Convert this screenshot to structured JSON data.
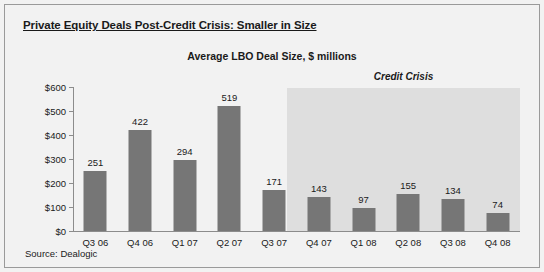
{
  "title": "Private Equity Deals Post-Credit Crisis: Smaller in Size",
  "source": "Source: Dealogic",
  "chart_data": {
    "type": "bar",
    "title": "Average LBO Deal Size, $ millions",
    "xlabel": "",
    "ylabel": "",
    "ylim": [
      0,
      600
    ],
    "ytick_labels": [
      "$0",
      "$100",
      "$200",
      "$300",
      "$400",
      "$500",
      "$600"
    ],
    "ytick_values": [
      0,
      100,
      200,
      300,
      400,
      500,
      600
    ],
    "grid": false,
    "legend": "none",
    "categories": [
      "Q3 06",
      "Q4 06",
      "Q1 07",
      "Q2 07",
      "Q3 07",
      "Q4 07",
      "Q1 08",
      "Q2 08",
      "Q3 08",
      "Q4 08"
    ],
    "values": [
      251,
      422,
      294,
      519,
      171,
      143,
      97,
      155,
      134,
      74
    ],
    "value_labels": [
      "251",
      "422",
      "294",
      "519",
      "171",
      "143",
      "97",
      "155",
      "134",
      "74"
    ],
    "annotations": [
      {
        "text": "Credit Crisis",
        "type": "shaded-region-label",
        "covers": [
          "Q3 07",
          "Q4 07",
          "Q1 08",
          "Q2 08",
          "Q3 08",
          "Q4 08"
        ]
      }
    ],
    "colors": {
      "bar": "#767676",
      "shaded_region": "#dedede",
      "background": "#f2f2f2",
      "axis": "#8c8c8c",
      "text": "#1a1a1a"
    }
  }
}
